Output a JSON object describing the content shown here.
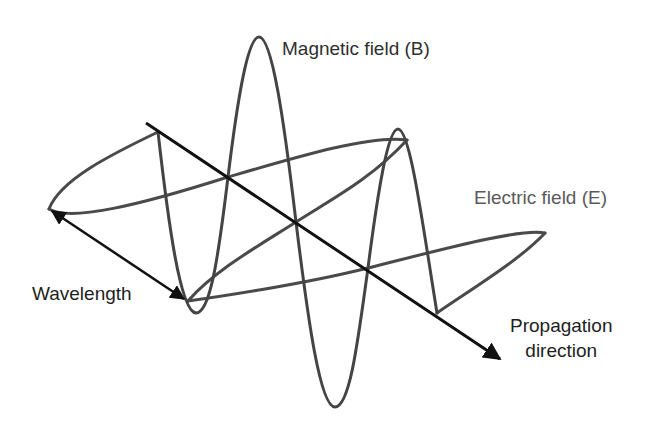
{
  "diagram": {
    "labels": {
      "magnetic_field": "Magnetic field (B)",
      "electric_field": "Electric field (E)",
      "wavelength": "Wavelength",
      "propagation_line1": "Propagation",
      "propagation_line2": "direction"
    },
    "colors": {
      "background": "#ffffff",
      "wave_stroke": "#4a4a4a",
      "axis_stroke": "#111111",
      "electric_label": "#5a5a5a",
      "magnetic_label": "#2f2f2f"
    },
    "elements": [
      {
        "id": "magnetic-wave",
        "type": "sinusoid",
        "plane": "vertical",
        "peaks": 2,
        "troughs": 2
      },
      {
        "id": "electric-wave",
        "type": "sinusoid",
        "plane": "horizontal",
        "peaks": 2,
        "troughs": 1
      },
      {
        "id": "propagation-axis",
        "type": "arrow",
        "direction": "down-right"
      },
      {
        "id": "wavelength-arrow",
        "type": "double-arrow"
      }
    ]
  }
}
